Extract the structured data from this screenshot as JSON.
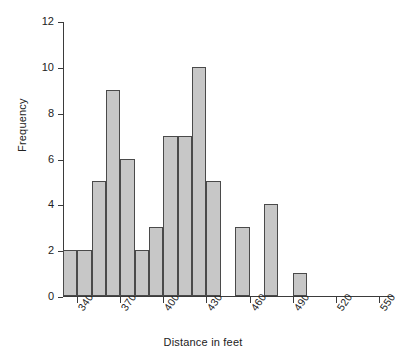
{
  "chart_data": {
    "type": "bar",
    "title": "",
    "subtitle": "",
    "xlabel": "Distance in feet",
    "ylabel": "Frequency",
    "grid": false,
    "legend": "none",
    "xlim": [
      330,
      560
    ],
    "ylim": [
      0,
      12
    ],
    "bin_width": 10,
    "x_tick_labels": [
      "340",
      "370",
      "400",
      "430",
      "460",
      "490",
      "520",
      "550"
    ],
    "x_tick_values": [
      340,
      370,
      400,
      430,
      460,
      490,
      520,
      550
    ],
    "y_tick_labels": [
      "0",
      "2",
      "4",
      "6",
      "8",
      "10",
      "12"
    ],
    "y_tick_values": [
      0,
      2,
      4,
      6,
      8,
      10,
      12
    ],
    "bin_starts": [
      330,
      340,
      350,
      360,
      370,
      380,
      390,
      400,
      410,
      420,
      430,
      440,
      450,
      460,
      470,
      480,
      490,
      500,
      510,
      520,
      530,
      540,
      550
    ],
    "categories": [
      "330-340",
      "340-350",
      "350-360",
      "360-370",
      "370-380",
      "380-390",
      "390-400",
      "400-410",
      "410-420",
      "420-430",
      "430-440",
      "440-450",
      "450-460",
      "460-470",
      "470-480",
      "480-490",
      "490-500",
      "500-510",
      "510-520",
      "520-530",
      "530-540",
      "540-550",
      "550-560"
    ],
    "values": [
      2,
      2,
      5,
      9,
      6,
      2,
      3,
      7,
      7,
      10,
      5,
      0,
      3,
      0,
      4,
      0,
      1,
      0,
      0,
      0,
      0,
      0,
      0
    ],
    "bar_face_color": "#c7c7c7",
    "bar_edge_color": "#4a4a4a",
    "axis_color": "#3b3b3b"
  }
}
